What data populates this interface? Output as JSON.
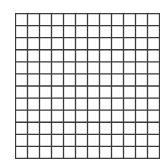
{
  "grid": {
    "rows": 12,
    "cols": 12,
    "line_color": "#3a3a3a",
    "background": "#ffffff",
    "line_width": 1.3
  }
}
